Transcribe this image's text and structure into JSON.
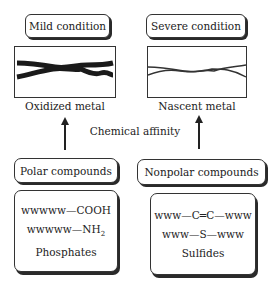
{
  "top": {
    "left": {
      "condition": "Mild condition",
      "caption": "Oxidized metal",
      "illustration": "thick-wavy-lines"
    },
    "right": {
      "condition": "Severe condition",
      "caption": "Nascent metal",
      "illustration": "thin-wavy-lines"
    }
  },
  "middle": {
    "label": "Chemical affinity"
  },
  "bottom": {
    "left": {
      "title": "Polar compounds",
      "formulas": [
        "wwwww—COOH",
        "wwwww—NH",
        "2"
      ],
      "name": "Phosphates"
    },
    "right": {
      "title": "Nonpolar compounds",
      "formulas": [
        "www—C═C—www",
        "www—S—www"
      ],
      "name": "Sulfides"
    }
  }
}
